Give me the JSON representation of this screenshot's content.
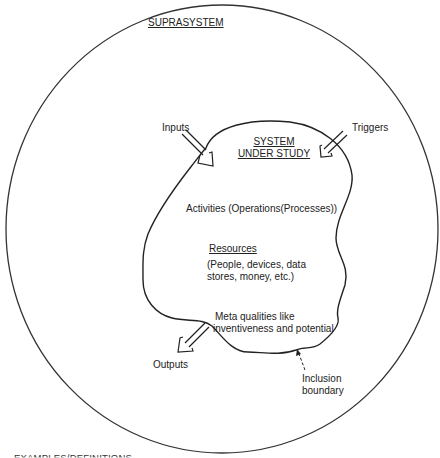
{
  "suprasystem": {
    "title": "SUPRASYSTEM"
  },
  "system": {
    "title_line1": "SYSTEM",
    "title_line2": "UNDER STUDY"
  },
  "labels": {
    "inputs": "Inputs",
    "triggers": "Triggers",
    "outputs": "Outputs",
    "activities": "Activities (Operations(Processes))",
    "resources_title": "Resources",
    "resources_line1": "(People, devices, data",
    "resources_line2": "stores, money, etc.)",
    "meta_line1": "Meta qualities like",
    "meta_line2": "inventiveness and potential",
    "inclusion_line1": "Inclusion",
    "inclusion_line2": "boundary"
  },
  "footer": {
    "partial_text": "EXAMPLES/DEFINITIONS"
  },
  "colors": {
    "line": "#222222",
    "background": "#ffffff"
  }
}
